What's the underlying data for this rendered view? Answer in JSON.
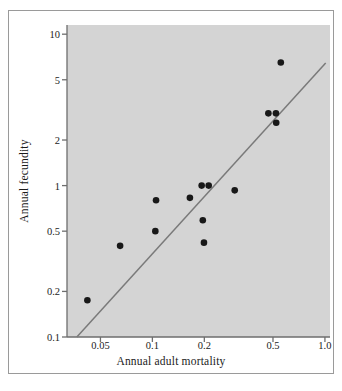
{
  "chart_data": {
    "type": "scatter",
    "title": "",
    "xlabel": "Annual adult mortality",
    "ylabel": "Annual fecundity",
    "xscale": "log",
    "yscale": "log",
    "xlim": [
      0.032,
      1.07
    ],
    "ylim": [
      0.1,
      11.5
    ],
    "grid": false,
    "legend": null,
    "x_ticks": [
      {
        "value": 0.05,
        "label": "0.05"
      },
      {
        "value": 0.1,
        "label": "0.1"
      },
      {
        "value": 0.2,
        "label": "0.2"
      },
      {
        "value": 0.5,
        "label": "0.5"
      },
      {
        "value": 1.0,
        "label": "1.0"
      }
    ],
    "y_ticks": [
      {
        "value": 10,
        "label": "10"
      },
      {
        "value": 5,
        "label": "5"
      },
      {
        "value": 2,
        "label": "2"
      },
      {
        "value": 1,
        "label": "1"
      },
      {
        "value": 0.5,
        "label": "0.5"
      },
      {
        "value": 0.2,
        "label": "0.2"
      },
      {
        "value": 0.1,
        "label": "0.1"
      }
    ],
    "points": [
      {
        "x": 0.042,
        "y": 0.175
      },
      {
        "x": 0.065,
        "y": 0.4
      },
      {
        "x": 0.105,
        "y": 0.8
      },
      {
        "x": 0.104,
        "y": 0.5
      },
      {
        "x": 0.165,
        "y": 0.83
      },
      {
        "x": 0.193,
        "y": 1.0
      },
      {
        "x": 0.212,
        "y": 1.0
      },
      {
        "x": 0.196,
        "y": 0.59
      },
      {
        "x": 0.199,
        "y": 0.42
      },
      {
        "x": 0.3,
        "y": 0.93
      },
      {
        "x": 0.47,
        "y": 3.0
      },
      {
        "x": 0.52,
        "y": 3.0
      },
      {
        "x": 0.522,
        "y": 2.6
      },
      {
        "x": 0.555,
        "y": 6.5
      }
    ],
    "trend_line": {
      "name": "fitted-regression-line",
      "x_start": 0.0365,
      "y_start": 0.1,
      "x_end": 1.01,
      "y_end": 6.45
    },
    "colors": {
      "plot_background": "#d4d4d4",
      "figure_background": "#ffffff",
      "point": "#181818",
      "line": "#7a7a7a",
      "axis": "#6e6e6e",
      "text": "#1b1b1b",
      "frame": "#9a9a9a"
    },
    "marker": {
      "shape": "circle",
      "size": 4.6
    }
  }
}
